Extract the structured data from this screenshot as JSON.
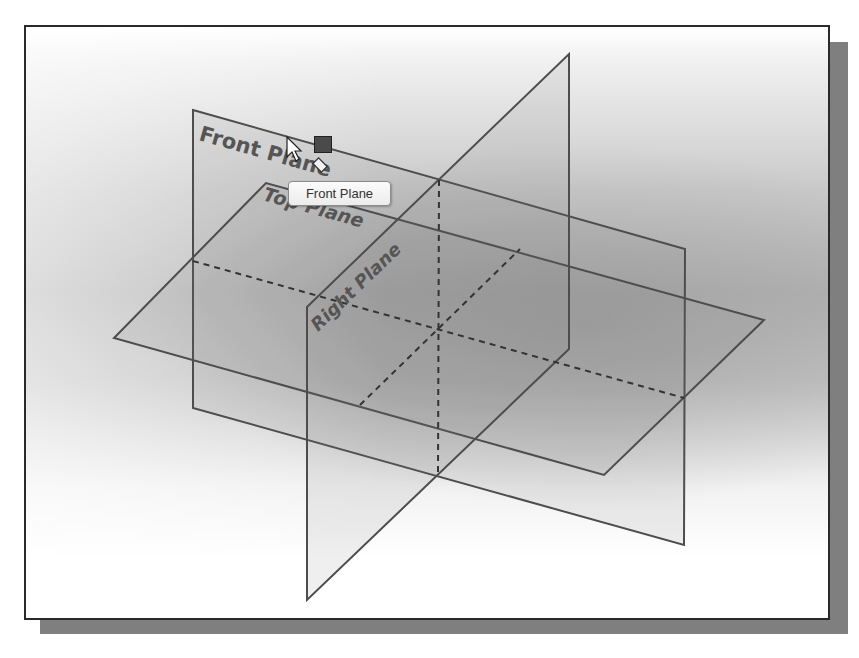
{
  "scene": {
    "planes": [
      {
        "name": "Front Plane",
        "label": "Front Plane"
      },
      {
        "name": "Top Plane",
        "label": "Top Plane"
      },
      {
        "name": "Right Plane",
        "label": "Right Plane"
      }
    ]
  },
  "tooltip": {
    "text": "Front Plane"
  },
  "cursor": {
    "icon": "arrow-cursor-icon"
  },
  "handle": {
    "icon": "selection-handle-icon"
  },
  "colors": {
    "edge": "#4d4d4d",
    "frame_border": "#2a2a2a",
    "shadow": "#7f7f7f",
    "handle": "#4a4a4a"
  }
}
